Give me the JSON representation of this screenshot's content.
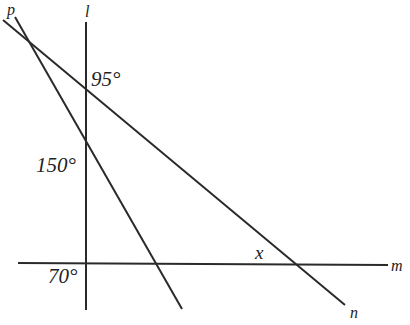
{
  "diagram": {
    "type": "geometry",
    "colors": {
      "background": "#ffffff",
      "stroke": "#2a2a2a",
      "text": "#222222"
    },
    "lines": [
      {
        "name": "l",
        "label": "l",
        "x1": 86,
        "y1": 22,
        "x2": 86,
        "y2": 310
      },
      {
        "name": "m",
        "label": "m",
        "x1": 18,
        "y1": 263,
        "x2": 390,
        "y2": 265
      },
      {
        "name": "n",
        "label": "n",
        "x1": 3,
        "y1": 20,
        "x2": 345,
        "y2": 305
      },
      {
        "name": "p",
        "label": "p",
        "x1": 15,
        "y1": 17,
        "x2": 182,
        "y2": 309
      }
    ],
    "labels": {
      "p": "p",
      "l": "l",
      "m": "m",
      "n": "n"
    },
    "angles": {
      "angle_ln": "95°",
      "angle_lp": "150°",
      "angle_lm": "70°",
      "angle_mn": "x"
    }
  }
}
